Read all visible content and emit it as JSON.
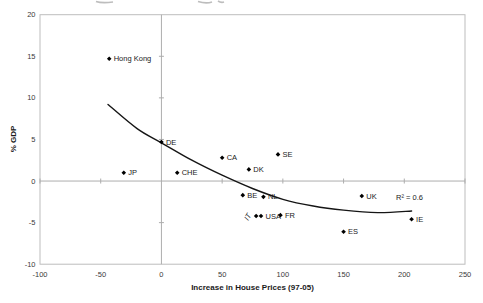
{
  "chart_data": {
    "type": "scatter",
    "title": "",
    "xlabel": "Increase in House Prices (97-05)",
    "ylabel": "% GDP",
    "xlim": [
      -100,
      250
    ],
    "ylim": [
      -10,
      20
    ],
    "xticks": [
      -100,
      -50,
      0,
      50,
      100,
      150,
      200,
      250
    ],
    "yticks": [
      20,
      15,
      10,
      5,
      0,
      -5,
      -10
    ],
    "grid": "off (only axis cross-lines at x=0 and y=0, plus plot border)",
    "legend": "none",
    "marker_shape": "diamond",
    "points": [
      {
        "label": "Hong Kong",
        "x": -43,
        "y": 14.7
      },
      {
        "label": "JP",
        "x": -31,
        "y": 1.0
      },
      {
        "label": "DE",
        "x": 0,
        "y": 4.7
      },
      {
        "label": "CHE",
        "x": 13,
        "y": 1.0
      },
      {
        "label": "CA",
        "x": 50,
        "y": 2.8
      },
      {
        "label": "DK",
        "x": 72,
        "y": 1.4
      },
      {
        "label": "SE",
        "x": 96,
        "y": 3.2
      },
      {
        "label": "BE",
        "x": 67,
        "y": -1.7
      },
      {
        "label": "NL",
        "x": 84,
        "y": -1.9
      },
      {
        "label": "IT",
        "x": 78,
        "y": -4.2,
        "label_offset": [
          -8,
          5
        ],
        "label_rotate": -60,
        "label_italic": true
      },
      {
        "label": "USA",
        "x": 82,
        "y": -4.2
      },
      {
        "label": "FR",
        "x": 98,
        "y": -4.1
      },
      {
        "label": "UK",
        "x": 165,
        "y": -1.8
      },
      {
        "label": "ES",
        "x": 150,
        "y": -6.1
      },
      {
        "label": "IE",
        "x": 206,
        "y": -4.6
      }
    ],
    "trendline": {
      "style": "solid black curve (power/log fit)",
      "r_squared_label": "R² = 0.6",
      "points": [
        [
          -44,
          9.2
        ],
        [
          -20,
          6.3
        ],
        [
          0,
          4.6
        ],
        [
          25,
          2.5
        ],
        [
          50,
          0.7
        ],
        [
          75,
          -0.9
        ],
        [
          100,
          -2.2
        ],
        [
          125,
          -3.0
        ],
        [
          150,
          -3.5
        ],
        [
          178,
          -3.8
        ],
        [
          206,
          -3.6
        ]
      ]
    }
  },
  "colors": {
    "background": "#ffffff",
    "axis_lines": "#adadad",
    "plot_border": "#bdbdbd",
    "marker": "#000000",
    "trendline": "#151515",
    "text": "#1a1a1a"
  }
}
